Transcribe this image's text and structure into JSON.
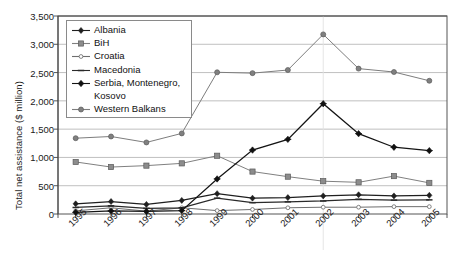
{
  "chart_data": {
    "type": "line",
    "title": "",
    "xlabel": "",
    "ylabel": "Total net assistance ($ million)",
    "categories": [
      "1995",
      "1996",
      "1997",
      "1998",
      "1999",
      "2000",
      "2001",
      "2002",
      "2003",
      "2004",
      "2005"
    ],
    "ylim": [
      0,
      3500
    ],
    "ytick_labels": [
      "0",
      "500",
      "1,000",
      "1,500",
      "2,000",
      "2,500",
      "3,000",
      "3,500"
    ],
    "ytick_values": [
      0,
      500,
      1000,
      1500,
      2000,
      2500,
      3000,
      3500
    ],
    "grid": "horizontal",
    "legend_position": "upper-left-inside",
    "series": [
      {
        "name": "Albania",
        "marker": "diamond-dark",
        "color": "#1f1f1f",
        "values": [
          180,
          220,
          170,
          240,
          360,
          280,
          290,
          320,
          340,
          320,
          330
        ]
      },
      {
        "name": "BiH",
        "marker": "square-gray",
        "color": "#808080",
        "values": [
          920,
          830,
          855,
          895,
          1030,
          750,
          660,
          580,
          560,
          670,
          550
        ]
      },
      {
        "name": "Croatia",
        "marker": "dash-open",
        "color": "#6e6e6e",
        "values": [
          55,
          110,
          50,
          110,
          60,
          80,
          110,
          120,
          120,
          130,
          130
        ]
      },
      {
        "name": "Macedonia",
        "marker": "dash-dark",
        "color": "#2a2a2a",
        "values": [
          115,
          145,
          100,
          110,
          280,
          200,
          215,
          230,
          260,
          245,
          250
        ]
      },
      {
        "name": "Serbia, Montenegro, Kosovo",
        "marker": "diamond-star",
        "color": "#141414",
        "values": [
          30,
          55,
          45,
          60,
          620,
          1130,
          1320,
          1950,
          1420,
          1180,
          1120
        ]
      },
      {
        "name": "Western Balkans",
        "marker": "circle-gray",
        "color": "#7d7d7d",
        "values": [
          1340,
          1370,
          1265,
          1425,
          2505,
          2490,
          2545,
          3175,
          2570,
          2510,
          2355
        ]
      }
    ]
  },
  "legend": {
    "entries": [
      {
        "label": "Albania"
      },
      {
        "label": "BiH"
      },
      {
        "label": "Croatia"
      },
      {
        "label": "Macedonia"
      },
      {
        "label": "Serbia, Montenegro,"
      },
      {
        "label": "Kosovo"
      },
      {
        "label": "Western Balkans"
      }
    ]
  }
}
